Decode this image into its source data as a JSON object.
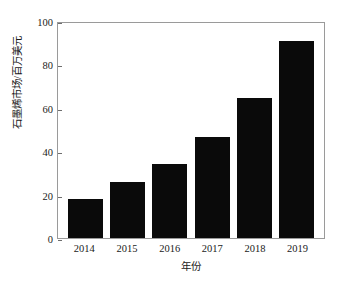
{
  "chart_data": {
    "type": "bar",
    "title": "",
    "categories": [
      "2014",
      "2015",
      "2016",
      "2017",
      "2018",
      "2019"
    ],
    "values": [
      18,
      26,
      34,
      46.5,
      64.5,
      91
    ],
    "xlabel": "年份",
    "ylabel": "石墨烯市场/百万美元",
    "ylim": [
      0,
      100
    ],
    "yticks": [
      "0",
      "20",
      "40",
      "60",
      "80",
      "100"
    ],
    "ytick_values": [
      0,
      20,
      40,
      60,
      80,
      100
    ],
    "grid": false,
    "legend": false,
    "bar_color": "#0a0a0a",
    "axis_color": "#9a9a9a",
    "background_color": "#ffffff"
  }
}
